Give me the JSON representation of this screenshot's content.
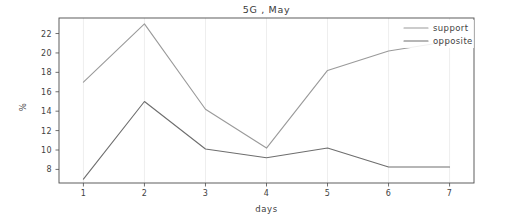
{
  "chart_data": {
    "type": "line",
    "title": "5G , May",
    "xlabel": "days",
    "ylabel": "%",
    "x": [
      1,
      2,
      3,
      4,
      5,
      6,
      7
    ],
    "categories": [
      "1",
      "2",
      "3",
      "4",
      "5",
      "6",
      "7"
    ],
    "xlim": [
      0.6,
      7.4
    ],
    "ylim": [
      6.6,
      23.6
    ],
    "yticks": [
      8,
      10,
      12,
      14,
      16,
      18,
      20,
      22
    ],
    "ytick_labels": [
      "8",
      "10",
      "12",
      "14",
      "16",
      "18",
      "20",
      "22"
    ],
    "xticks": [
      1,
      2,
      3,
      4,
      5,
      6,
      7
    ],
    "xtick_labels": [
      "1",
      "2",
      "3",
      "4",
      "5",
      "6",
      "7"
    ],
    "grid": true,
    "grid_axis": "x",
    "legend_position": "top-right",
    "series": [
      {
        "name": "support",
        "color": "#9a9a9a",
        "values": [
          17.0,
          23.0,
          14.2,
          10.2,
          18.2,
          20.2,
          21.2
        ]
      },
      {
        "name": "opposite",
        "color": "#6e6e6e",
        "values": [
          7.0,
          15.0,
          10.1,
          9.2,
          10.2,
          8.25,
          8.25
        ]
      }
    ]
  },
  "legend": {
    "entries": [
      {
        "label": "support"
      },
      {
        "label": "opposite"
      }
    ]
  },
  "colors": {
    "background": "#ffffff",
    "axis": "#4c4c4c",
    "grid": "#e6e6e6",
    "text": "#3f3f3f"
  }
}
